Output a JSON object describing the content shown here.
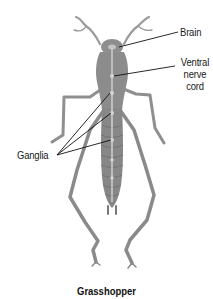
{
  "diagram": {
    "title": "Grasshopper",
    "labels": {
      "brain": "Brain",
      "ventral_nerve_cord": [
        "Ventral",
        "nerve",
        "cord"
      ],
      "ganglia": "Ganglia"
    },
    "colors": {
      "body": "#8e8e8e",
      "body_dark": "#6f6f6f",
      "nerve_cord": "#c9c9c9",
      "leader_line": "#111111",
      "background": "#ffffff",
      "text": "#1a1a1a"
    },
    "leader_lines": [
      {
        "label": "brain",
        "from": [
          178,
          32
        ],
        "to": [
          121,
          47
        ]
      },
      {
        "label": "ventral_nerve_cord",
        "from": [
          175,
          66
        ],
        "to": [
          114,
          76
        ]
      },
      {
        "label": "ganglia",
        "from": [
          57,
          155
        ],
        "to": [
          110,
          93
        ]
      },
      {
        "label": "ganglia",
        "from": [
          57,
          155
        ],
        "to": [
          113,
          113
        ]
      },
      {
        "label": "ganglia",
        "from": [
          57,
          155
        ],
        "to": [
          113,
          140
        ]
      }
    ]
  }
}
